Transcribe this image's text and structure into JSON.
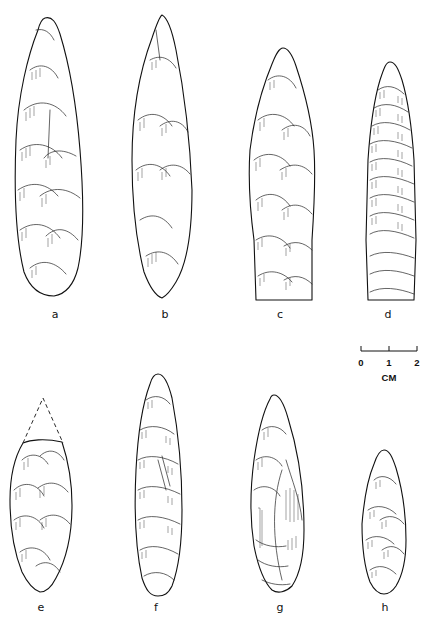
{
  "figure": {
    "type": "archaeological lithic illustration plate",
    "background": "#ffffff",
    "ink_color": "#111111"
  },
  "specimens": [
    {
      "id": "a",
      "label": "a",
      "shape": "lanceolate, rounded base",
      "label_x": 55,
      "label_y": 309
    },
    {
      "id": "b",
      "label": "b",
      "shape": "lanceolate, pointed base",
      "label_x": 165,
      "label_y": 309
    },
    {
      "id": "c",
      "label": "c",
      "shape": "lanceolate, square base",
      "label_x": 280,
      "label_y": 309
    },
    {
      "id": "d",
      "label": "d",
      "shape": "parallel-flaked, square stemmed base",
      "label_x": 388,
      "label_y": 309
    },
    {
      "id": "e",
      "label": "e",
      "shape": "broken tip (dashed reconstruction)",
      "label_x": 41,
      "label_y": 602
    },
    {
      "id": "f",
      "label": "f",
      "shape": "narrow lanceolate",
      "label_x": 156,
      "label_y": 602
    },
    {
      "id": "g",
      "label": "g",
      "shape": "lanceolate, asymmetric",
      "label_x": 280,
      "label_y": 602
    },
    {
      "id": "h",
      "label": "h",
      "shape": "small lanceolate",
      "label_x": 385,
      "label_y": 602
    }
  ],
  "scale_bar": {
    "ticks": [
      "0",
      "1",
      "2"
    ],
    "unit": "CM"
  }
}
